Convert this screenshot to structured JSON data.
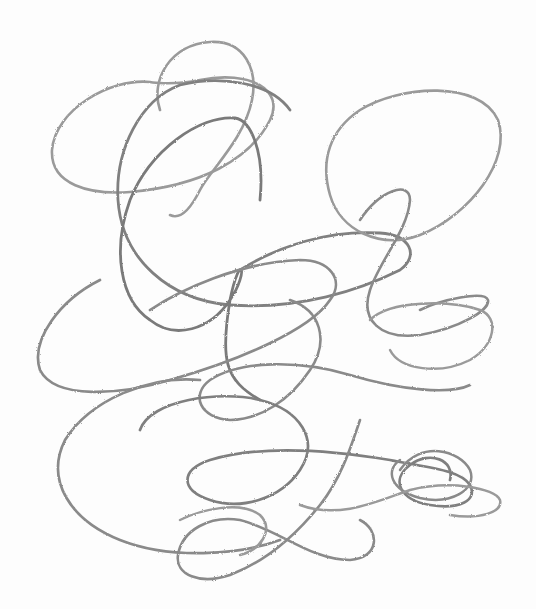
{
  "image": {
    "subject": "abstract pencil scribble of overlapping looping curves",
    "background_color": "#fdfdfd",
    "stroke_color": "#8a8a8a",
    "stroke_color_dark": "#7a7a7a",
    "width": 536,
    "height": 609
  }
}
